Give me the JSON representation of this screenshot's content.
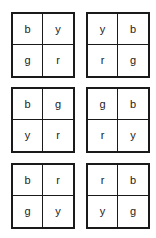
{
  "grids": [
    {
      "cells": [
        "b",
        "y",
        "g",
        "r"
      ]
    },
    {
      "cells": [
        "y",
        "b",
        "r",
        "g"
      ]
    },
    {
      "cells": [
        "b",
        "g",
        "y",
        "r"
      ]
    },
    {
      "cells": [
        "g",
        "b",
        "r",
        "y"
      ]
    },
    {
      "cells": [
        "b",
        "r",
        "g",
        "y"
      ]
    },
    {
      "cells": [
        "r",
        "b",
        "y",
        "g"
      ]
    }
  ]
}
